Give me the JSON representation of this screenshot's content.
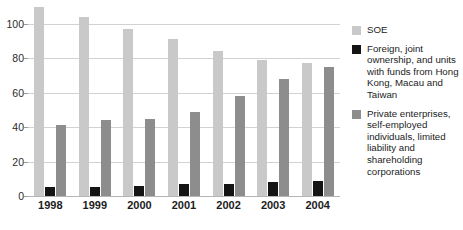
{
  "chart_data": {
    "type": "bar",
    "title": "",
    "subtitle": "",
    "xlabel": "",
    "ylabel": "",
    "categories": [
      "1998",
      "1999",
      "2000",
      "2001",
      "2002",
      "2003",
      "2004"
    ],
    "series": [
      {
        "name": "SOE",
        "color": "#c9c9c9",
        "values": [
          110,
          104,
          97,
          91,
          84,
          79,
          77
        ]
      },
      {
        "name": "Foreign, joint ownership, and units with funds from Hong Kong, Macau and Taiwan",
        "color": "#141414",
        "values": [
          5,
          5,
          6,
          7,
          7,
          8,
          9
        ]
      },
      {
        "name": "Private enterprises, self-employed individuals, limited liability and shareholding corporations",
        "color": "#8d8d8d",
        "values": [
          41,
          44,
          45,
          49,
          58,
          68,
          75
        ]
      }
    ],
    "ylim": [
      0,
      111.5
    ],
    "yticks": [
      0,
      20,
      40,
      60,
      80,
      100
    ],
    "ytick_labels": [
      "0",
      "20",
      "40",
      "60",
      "80",
      "100"
    ],
    "grid": true,
    "legend_position": "right"
  },
  "legend": {
    "items": [
      {
        "label": "SOE",
        "color": "#c9c9c9"
      },
      {
        "label": "Foreign, joint ownership, and units with funds from Hong Kong, Macau and Taiwan",
        "color": "#141414"
      },
      {
        "label": "Private enterprises, self-employed individuals, limited liability and shareholding corporations",
        "color": "#8d8d8d"
      }
    ]
  },
  "colors": {
    "soe": "#c9c9c9",
    "foreign": "#141414",
    "private": "#8d8d8d",
    "gridline": "#d2d2d2",
    "axis": "#b4b4b4",
    "text": "#1c1c1c",
    "background": "#ffffff"
  }
}
